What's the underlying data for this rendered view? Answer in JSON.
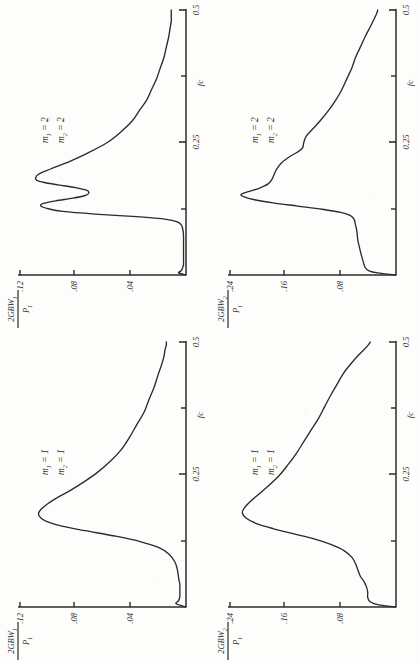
{
  "document": {
    "type": "scanned-figure-page",
    "orientation_note": "figures printed sideways (rotated 90 degrees counter-clockwise)",
    "ink_color": "#2b2b2b",
    "paper_color": "#fdfdfb"
  },
  "axis_common": {
    "x_axis_label": "fc",
    "x_ticks": [
      "0.25",
      "0.5"
    ],
    "x_tick_values": [
      0.25,
      0.5
    ],
    "x_minor_tick_values": [
      0.125,
      0.375
    ],
    "x_range": [
      0,
      0.5
    ]
  },
  "panels": [
    {
      "id": "top-left",
      "position": "top-left",
      "y_axis_label": {
        "numerator": "2GBW",
        "numerator_sub": "1",
        "denominator": "P",
        "denominator_sub": "1"
      },
      "y_ticks": [
        ".04",
        ".08",
        ".12"
      ],
      "y_tick_values": [
        0.04,
        0.08,
        0.12
      ],
      "y_range": [
        0,
        0.135
      ],
      "params": [
        {
          "symbol": "m",
          "sub": "1",
          "value": "2"
        },
        {
          "symbol": "m",
          "sub": "2",
          "value": "2"
        }
      ],
      "x_axis_label": "fc",
      "x_ticks": [
        "0.25",
        "0.5"
      ]
    },
    {
      "id": "top-right",
      "position": "top-right",
      "y_axis_label": {
        "numerator": "2GBW",
        "numerator_sub": "2",
        "denominator": "P",
        "denominator_sub": "1"
      },
      "y_ticks": [
        ".08",
        ".16",
        ".24"
      ],
      "y_tick_values": [
        0.08,
        0.16,
        0.24
      ],
      "y_range": [
        0,
        0.27
      ],
      "params": [
        {
          "symbol": "m",
          "sub": "1",
          "value": "2"
        },
        {
          "symbol": "m",
          "sub": "2",
          "value": "2"
        }
      ],
      "x_axis_label": "fc",
      "x_ticks": [
        "0.25",
        "0.5"
      ]
    },
    {
      "id": "bottom-left",
      "position": "bottom-left",
      "y_axis_label": {
        "numerator": "2GBW",
        "numerator_sub": "1",
        "denominator": "P",
        "denominator_sub": "1"
      },
      "y_ticks": [
        ".04",
        ".08",
        ".12"
      ],
      "y_tick_values": [
        0.04,
        0.08,
        0.12
      ],
      "y_range": [
        0,
        0.135
      ],
      "params": [
        {
          "symbol": "m",
          "sub": "1",
          "value": "1"
        },
        {
          "symbol": "m",
          "sub": "2",
          "value": "1"
        }
      ],
      "x_axis_label": "fc",
      "x_ticks": [
        "0.25",
        "0.5"
      ]
    },
    {
      "id": "bottom-right",
      "position": "bottom-right",
      "y_axis_label": {
        "numerator": "2GBW",
        "numerator_sub": "2",
        "denominator": "P",
        "denominator_sub": "1"
      },
      "y_ticks": [
        ".08",
        ".16",
        ".24"
      ],
      "y_tick_values": [
        0.08,
        0.16,
        0.24
      ],
      "y_range": [
        0,
        0.27
      ],
      "params": [
        {
          "symbol": "m",
          "sub": "1",
          "value": "1"
        },
        {
          "symbol": "m",
          "sub": "2",
          "value": "1"
        }
      ],
      "x_axis_label": "fc",
      "x_ticks": [
        "0.25",
        "0.5"
      ]
    }
  ],
  "chart_data": [
    {
      "type": "line",
      "id": "top-left",
      "title": "",
      "xlabel": "fc",
      "ylabel": "2GBW1/P1",
      "xlim": [
        0,
        0.5
      ],
      "ylim": [
        0,
        0.135
      ],
      "grid": false,
      "legend": "none",
      "annotations": [
        "m1 = 2",
        "m2 = 2"
      ],
      "x": [
        0.0,
        0.004,
        0.008,
        0.012,
        0.016,
        0.02,
        0.03,
        0.04,
        0.05,
        0.06,
        0.07,
        0.08,
        0.09,
        0.095,
        0.1,
        0.105,
        0.11,
        0.115,
        0.12,
        0.125,
        0.13,
        0.135,
        0.14,
        0.145,
        0.15,
        0.155,
        0.16,
        0.165,
        0.17,
        0.175,
        0.18,
        0.19,
        0.2,
        0.215,
        0.23,
        0.25,
        0.27,
        0.29,
        0.31,
        0.33,
        0.35,
        0.37,
        0.39,
        0.41,
        0.43,
        0.45,
        0.465,
        0.478,
        0.488,
        0.494,
        0.498,
        0.5
      ],
      "y": [
        0.0,
        0.006,
        0.004,
        0.003,
        0.0025,
        0.002,
        0.002,
        0.002,
        0.002,
        0.002,
        0.002,
        0.0022,
        0.003,
        0.004,
        0.007,
        0.016,
        0.04,
        0.074,
        0.1,
        0.112,
        0.118,
        0.116,
        0.106,
        0.092,
        0.082,
        0.079,
        0.081,
        0.09,
        0.104,
        0.116,
        0.122,
        0.12,
        0.11,
        0.094,
        0.08,
        0.064,
        0.053,
        0.044,
        0.038,
        0.032,
        0.028,
        0.024,
        0.021,
        0.018,
        0.016,
        0.014,
        0.013,
        0.012,
        0.012,
        0.012,
        0.012,
        0.012
      ]
    },
    {
      "type": "line",
      "id": "top-right",
      "title": "",
      "xlabel": "fc",
      "ylabel": "2GBW2/P1",
      "xlim": [
        0,
        0.5
      ],
      "ylim": [
        0,
        0.27
      ],
      "grid": false,
      "legend": "none",
      "annotations": [
        "m1 = 2",
        "m2 = 2"
      ],
      "x": [
        0.0,
        0.004,
        0.008,
        0.014,
        0.02,
        0.028,
        0.036,
        0.045,
        0.055,
        0.065,
        0.075,
        0.085,
        0.095,
        0.105,
        0.112,
        0.118,
        0.124,
        0.13,
        0.136,
        0.142,
        0.148,
        0.152,
        0.156,
        0.16,
        0.166,
        0.172,
        0.18,
        0.19,
        0.2,
        0.212,
        0.224,
        0.232,
        0.24,
        0.25,
        0.262,
        0.275,
        0.29,
        0.31,
        0.33,
        0.35,
        0.37,
        0.39,
        0.41,
        0.43,
        0.45,
        0.468,
        0.482,
        0.492,
        0.498,
        0.5
      ],
      "y": [
        0.0,
        0.03,
        0.044,
        0.05,
        0.052,
        0.054,
        0.056,
        0.058,
        0.06,
        0.062,
        0.063,
        0.064,
        0.066,
        0.068,
        0.074,
        0.09,
        0.12,
        0.16,
        0.2,
        0.23,
        0.248,
        0.252,
        0.244,
        0.232,
        0.218,
        0.208,
        0.202,
        0.198,
        0.194,
        0.186,
        0.172,
        0.16,
        0.152,
        0.15,
        0.146,
        0.136,
        0.124,
        0.11,
        0.098,
        0.088,
        0.08,
        0.072,
        0.066,
        0.058,
        0.05,
        0.042,
        0.036,
        0.032,
        0.03,
        0.03
      ]
    },
    {
      "type": "line",
      "id": "bottom-left",
      "title": "",
      "xlabel": "fc",
      "ylabel": "2GBW1/P1",
      "xlim": [
        0,
        0.5
      ],
      "ylim": [
        0,
        0.135
      ],
      "grid": false,
      "legend": "none",
      "annotations": [
        "m1 = 1",
        "m2 = 1"
      ],
      "x": [
        0.0,
        0.006,
        0.012,
        0.02,
        0.03,
        0.042,
        0.055,
        0.07,
        0.085,
        0.1,
        0.112,
        0.124,
        0.134,
        0.144,
        0.152,
        0.16,
        0.168,
        0.176,
        0.184,
        0.194,
        0.206,
        0.22,
        0.236,
        0.254,
        0.274,
        0.296,
        0.32,
        0.344,
        0.368,
        0.392,
        0.414,
        0.436,
        0.456,
        0.472,
        0.486,
        0.494,
        0.5
      ],
      "y": [
        0.0,
        0.008,
        0.006,
        0.005,
        0.005,
        0.005,
        0.006,
        0.007,
        0.009,
        0.014,
        0.022,
        0.038,
        0.058,
        0.082,
        0.1,
        0.112,
        0.118,
        0.12,
        0.118,
        0.113,
        0.105,
        0.094,
        0.083,
        0.072,
        0.062,
        0.053,
        0.046,
        0.04,
        0.034,
        0.03,
        0.026,
        0.023,
        0.02,
        0.018,
        0.017,
        0.016,
        0.016
      ]
    },
    {
      "type": "line",
      "id": "bottom-right",
      "title": "",
      "xlabel": "fc",
      "ylabel": "2GBW2/P1",
      "xlim": [
        0,
        0.27
      ],
      "ylim": [
        0,
        0.27
      ],
      "grid": false,
      "legend": "none",
      "annotations": [
        "m1 = 1",
        "m2 = 1"
      ],
      "x": [
        0.0,
        0.004,
        0.01,
        0.018,
        0.028,
        0.038,
        0.048,
        0.058,
        0.07,
        0.082,
        0.094,
        0.106,
        0.118,
        0.128,
        0.138,
        0.148,
        0.158,
        0.168,
        0.178,
        0.188,
        0.2,
        0.214,
        0.23,
        0.248,
        0.268,
        0.29,
        0.312,
        0.334,
        0.356,
        0.378,
        0.4,
        0.42,
        0.44,
        0.458,
        0.474,
        0.488,
        0.496,
        0.5
      ],
      "y": [
        0.0,
        0.028,
        0.042,
        0.046,
        0.046,
        0.048,
        0.052,
        0.058,
        0.062,
        0.066,
        0.072,
        0.084,
        0.106,
        0.132,
        0.166,
        0.2,
        0.228,
        0.244,
        0.25,
        0.246,
        0.236,
        0.222,
        0.206,
        0.19,
        0.176,
        0.162,
        0.15,
        0.138,
        0.126,
        0.116,
        0.106,
        0.096,
        0.086,
        0.074,
        0.062,
        0.05,
        0.044,
        0.042
      ]
    }
  ]
}
